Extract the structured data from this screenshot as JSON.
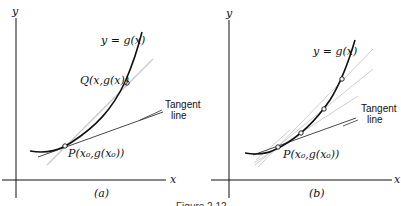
{
  "figure": {
    "caption": "Figure 2.12",
    "panels": [
      {
        "id": "a",
        "panel_label": "(a)",
        "axis_x_label": "x",
        "axis_y_label": "y",
        "curve_label": "y = g(x)",
        "point_P_label": "P(x₀,g(x₀))",
        "point_Q_label": "Q(x,g(x))",
        "tangent_label_line1": "Tangent",
        "tangent_label_line2": "line"
      },
      {
        "id": "b",
        "panel_label": "(b)",
        "axis_x_label": "x",
        "axis_y_label": "y",
        "curve_label": "y = g(x)",
        "point_P_label": "P(x₀,g(x₀))",
        "tangent_label_line1": "Tangent",
        "tangent_label_line2": "line"
      }
    ]
  },
  "colors": {
    "ink": "#111111",
    "secant": "#c8c8c8",
    "tangent": "#333333"
  }
}
